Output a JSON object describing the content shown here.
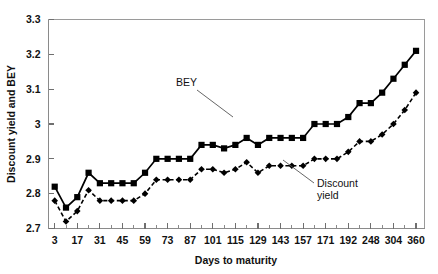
{
  "chart_data": {
    "type": "line",
    "title": "",
    "xlabel": "Days to maturity",
    "ylabel": "Discount yield and BEY",
    "grid": false,
    "legend_position": "inline-annotations",
    "xlim": [
      0,
      33
    ],
    "ylim": [
      2.7,
      3.3
    ],
    "ytick_labels": [
      "2.7",
      "2.8",
      "2.9",
      "3",
      "3.1",
      "3.2",
      "3.3"
    ],
    "ytick_values": [
      2.7,
      2.8,
      2.9,
      3.0,
      3.1,
      3.2,
      3.3
    ],
    "xtick_labels": [
      "3",
      "17",
      "31",
      "45",
      "59",
      "73",
      "87",
      "101",
      "115",
      "129",
      "143",
      "157",
      "171",
      "192",
      "248",
      "304",
      "360"
    ],
    "x_categories": [
      "3",
      "10",
      "17",
      "24",
      "31",
      "38",
      "45",
      "52",
      "59",
      "66",
      "73",
      "80",
      "87",
      "94",
      "101",
      "108",
      "115",
      "122",
      "129",
      "136",
      "143",
      "150",
      "157",
      "164",
      "171",
      "180",
      "192",
      "220",
      "248",
      "276",
      "304",
      "332",
      "360"
    ],
    "annotations": [
      {
        "text": "BEY",
        "series": "BEY"
      },
      {
        "text": "Discount",
        "series": "Discount yield"
      },
      {
        "text": "yield",
        "series": "Discount yield"
      }
    ],
    "series": [
      {
        "name": "BEY",
        "marker": "square",
        "linestyle": "solid",
        "values": [
          2.82,
          2.76,
          2.79,
          2.86,
          2.83,
          2.83,
          2.83,
          2.83,
          2.86,
          2.9,
          2.9,
          2.9,
          2.9,
          2.94,
          2.94,
          2.93,
          2.94,
          2.96,
          2.94,
          2.96,
          2.96,
          2.96,
          2.96,
          3.0,
          3.0,
          3.0,
          3.02,
          3.06,
          3.06,
          3.09,
          3.13,
          3.17,
          3.21
        ]
      },
      {
        "name": "Discount yield",
        "marker": "diamond",
        "linestyle": "dashed",
        "values": [
          2.78,
          2.72,
          2.75,
          2.81,
          2.78,
          2.78,
          2.78,
          2.78,
          2.8,
          2.84,
          2.84,
          2.84,
          2.84,
          2.87,
          2.87,
          2.86,
          2.87,
          2.89,
          2.86,
          2.88,
          2.88,
          2.88,
          2.88,
          2.9,
          2.9,
          2.9,
          2.92,
          2.95,
          2.95,
          2.97,
          3.0,
          3.04,
          3.09
        ]
      }
    ]
  },
  "axes": {
    "ylabel": "Discount yield and BEY",
    "xlabel": "Days to maturity"
  },
  "labels": {
    "bey": "BEY",
    "discount_line1": "Discount",
    "discount_line2": "yield"
  }
}
